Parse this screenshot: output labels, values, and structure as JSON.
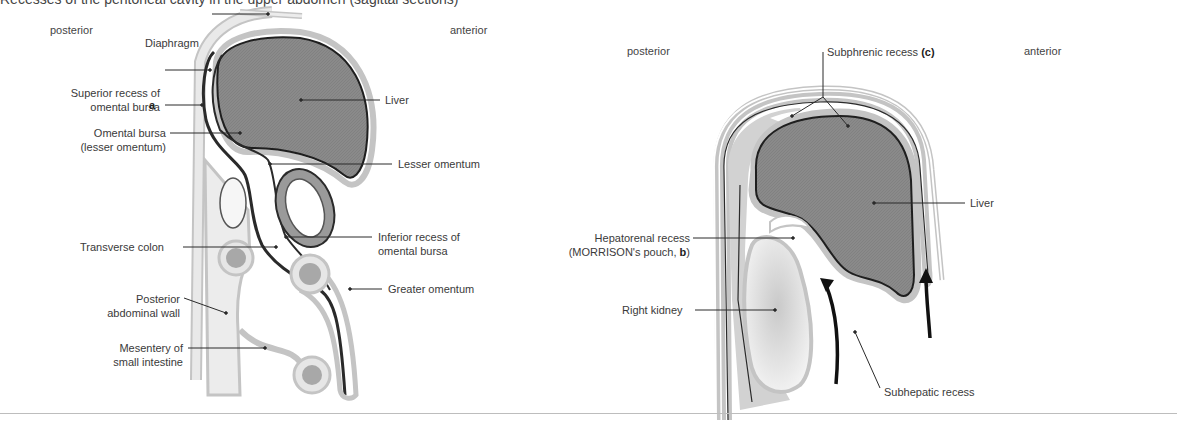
{
  "figure": {
    "title_cut": "Recesses of the peritoneal cavity in the upper abdomen (sagittal sections)",
    "colors": {
      "liver_fill": "#8a8a8a",
      "peritoneum_gray": "#c4c4c4",
      "tissue_light": "#e6e6e6",
      "outline": "#1f1f1f",
      "label_text": "#3a3a3a",
      "separator": "#bdbdbd"
    },
    "left_panel": {
      "orientation": {
        "left": "posterior",
        "right": "anterior"
      },
      "labels": {
        "diaphragm": "Diaphragm",
        "superior_recess_1": "Superior recess of",
        "superior_recess_2": "omental bursa",
        "a": "a",
        "omental_bursa_1": "Omental bursa",
        "omental_bursa_2": "(lesser omentum)",
        "transverse_colon": "Transverse colon",
        "posterior_wall_1": "Posterior",
        "posterior_wall_2": "abdominal wall",
        "mesentery_1": "Mesentery of",
        "mesentery_2": "small intestine",
        "liver": "Liver",
        "lesser_omentum": "Lesser omentum",
        "inferior_recess_1": "Inferior recess of",
        "inferior_recess_2": "omental bursa",
        "greater_omentum": "Greater omentum"
      }
    },
    "right_panel": {
      "orientation": {
        "left": "posterior",
        "right": "anterior"
      },
      "labels": {
        "subphrenic": "Subphrenic recess ",
        "subphrenic_letter": "(c)",
        "liver": "Liver",
        "hepatorenal_1": "Hepatorenal recess",
        "hepatorenal_2": "(MORRISON's pouch, ",
        "hepatorenal_letter": "b",
        "hepatorenal_close": ")",
        "right_kidney": "Right kidney",
        "subhepatic": "Subhepatic recess"
      }
    }
  }
}
